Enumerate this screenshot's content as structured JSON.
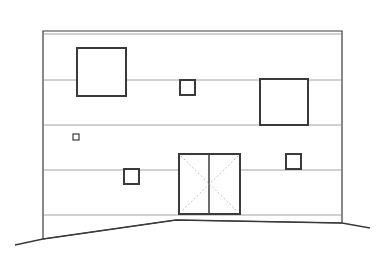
{
  "drawing": {
    "type": "building-elevation",
    "colors": {
      "background": "#ffffff",
      "line": "#3a3a3a",
      "thin_line": "#8a8a8a",
      "dotted": "#b0b0b0"
    },
    "wall": {
      "left": 43,
      "right": 342,
      "top": 31,
      "top_inner": 34,
      "bottom_left": 239,
      "bottom_right": 223
    },
    "floor_lines_y": [
      80,
      125,
      170,
      215
    ],
    "windows": [
      {
        "id": "large-upper-left",
        "x": 77,
        "y": 48,
        "w": 49,
        "h": 48
      },
      {
        "id": "small-upper-center",
        "x": 180,
        "y": 80,
        "w": 15,
        "h": 15
      },
      {
        "id": "large-upper-right",
        "x": 260,
        "y": 79,
        "w": 48,
        "h": 46
      },
      {
        "id": "tiny-left",
        "x": 73,
        "y": 134,
        "w": 6,
        "h": 6
      },
      {
        "id": "small-lower-left",
        "x": 124,
        "y": 169,
        "w": 15,
        "h": 15
      },
      {
        "id": "small-lower-right",
        "x": 286,
        "y": 154,
        "w": 15,
        "h": 15
      }
    ],
    "door": {
      "x": 179,
      "y": 154,
      "w": 61,
      "h": 60,
      "mullion_x": 209
    },
    "ground_points": "15,245 43,239 176,220 342,223 370,228"
  }
}
